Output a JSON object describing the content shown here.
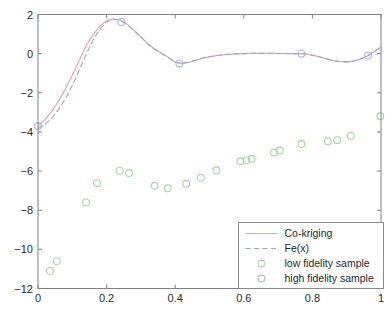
{
  "chart_data": {
    "type": "line",
    "title": "",
    "subtitle": "",
    "xlabel": "",
    "ylabel": "",
    "xlim": [
      0,
      1
    ],
    "ylim": [
      -12,
      2
    ],
    "grid": false,
    "xticks": [
      0,
      0.2,
      0.4,
      0.6,
      0.8,
      1
    ],
    "xtick_labels": [
      "0",
      "0.2",
      "0.4",
      "0.6",
      "0.8",
      "1"
    ],
    "yticks": [
      2,
      0,
      -2,
      -4,
      -6,
      -8,
      -10,
      -12
    ],
    "ytick_labels": [
      "2",
      "0",
      "-2",
      "-4",
      "-6",
      "-8",
      "-10",
      "-12"
    ],
    "legend": {
      "position": "lower right",
      "entries": [
        {
          "label": "Co-kriging",
          "marker": "line-solid",
          "color": "#e8a0a4"
        },
        {
          "label": "Fe(x)",
          "marker": "line-dashed",
          "color": "#9aa6c4"
        },
        {
          "label": "low fidelity sample",
          "marker": "circle",
          "color": "#a8d3a8"
        },
        {
          "label": "high fidelity sample",
          "marker": "circle",
          "color": "#a9b6d6"
        }
      ]
    },
    "series": [
      {
        "name": "Co-kriging",
        "type": "line",
        "style": "solid",
        "color": "#e8a0a4",
        "x": [
          0,
          0.02,
          0.04,
          0.06,
          0.08,
          0.1,
          0.12,
          0.14,
          0.16,
          0.18,
          0.2,
          0.22,
          0.24,
          0.26,
          0.28,
          0.3,
          0.32,
          0.34,
          0.36,
          0.38,
          0.4,
          0.42,
          0.44,
          0.46,
          0.48,
          0.5,
          0.52,
          0.54,
          0.56,
          0.58,
          0.6,
          0.62,
          0.64,
          0.66,
          0.68,
          0.7,
          0.72,
          0.74,
          0.76,
          0.78,
          0.8,
          0.82,
          0.84,
          0.86,
          0.88,
          0.9,
          0.92,
          0.94,
          0.96,
          0.98,
          1
        ],
        "y": [
          -3.7,
          -3.38,
          -2.95,
          -2.42,
          -1.8,
          -1.1,
          -0.35,
          0.4,
          0.95,
          1.4,
          1.68,
          1.77,
          1.72,
          1.5,
          1.2,
          0.85,
          0.52,
          0.24,
          0.02,
          -0.2,
          -0.44,
          -0.5,
          -0.44,
          -0.34,
          -0.24,
          -0.16,
          -0.1,
          -0.06,
          -0.03,
          -0.01,
          0.0,
          0.02,
          0.02,
          0.02,
          0.02,
          0.01,
          0.01,
          0.0,
          0.0,
          -0.02,
          -0.08,
          -0.16,
          -0.26,
          -0.35,
          -0.4,
          -0.42,
          -0.38,
          -0.28,
          -0.12,
          0.1,
          0.33
        ]
      },
      {
        "name": "Fe(x)",
        "type": "line",
        "style": "dashed",
        "color": "#9aa6c4",
        "x": [
          0,
          0.02,
          0.04,
          0.06,
          0.08,
          0.1,
          0.12,
          0.14,
          0.16,
          0.18,
          0.2,
          0.22,
          0.24,
          0.26,
          0.28,
          0.3,
          0.32,
          0.34,
          0.36,
          0.38,
          0.4,
          0.42,
          0.44,
          0.46,
          0.48,
          0.5,
          0.52,
          0.54,
          0.56,
          0.58,
          0.6,
          0.62,
          0.64,
          0.66,
          0.68,
          0.7,
          0.72,
          0.74,
          0.76,
          0.78,
          0.8,
          0.82,
          0.84,
          0.86,
          0.88,
          0.9,
          0.92,
          0.94,
          0.96,
          0.98,
          1
        ],
        "y": [
          -3.82,
          -3.62,
          -3.3,
          -2.85,
          -2.3,
          -1.62,
          -0.85,
          -0.05,
          0.68,
          1.25,
          1.62,
          1.76,
          1.7,
          1.48,
          1.18,
          0.84,
          0.5,
          0.22,
          0.0,
          -0.2,
          -0.44,
          -0.5,
          -0.44,
          -0.34,
          -0.24,
          -0.16,
          -0.1,
          -0.06,
          -0.03,
          -0.01,
          0.0,
          0.02,
          0.02,
          0.02,
          0.02,
          0.01,
          0.01,
          0.0,
          0.0,
          -0.02,
          -0.08,
          -0.16,
          -0.26,
          -0.35,
          -0.4,
          -0.42,
          -0.38,
          -0.28,
          -0.12,
          0.1,
          0.33
        ]
      },
      {
        "name": "low fidelity sample",
        "type": "scatter",
        "marker": "circle-open",
        "color": "#a8d3a8",
        "points": [
          {
            "x": 0.035,
            "y": -11.1
          },
          {
            "x": 0.055,
            "y": -10.6
          },
          {
            "x": 0.14,
            "y": -7.6
          },
          {
            "x": 0.172,
            "y": -6.62
          },
          {
            "x": 0.238,
            "y": -5.98
          },
          {
            "x": 0.265,
            "y": -6.1
          },
          {
            "x": 0.34,
            "y": -6.75
          },
          {
            "x": 0.378,
            "y": -6.88
          },
          {
            "x": 0.432,
            "y": -6.65
          },
          {
            "x": 0.475,
            "y": -6.34
          },
          {
            "x": 0.52,
            "y": -5.96
          },
          {
            "x": 0.59,
            "y": -5.5
          },
          {
            "x": 0.608,
            "y": -5.44
          },
          {
            "x": 0.623,
            "y": -5.37
          },
          {
            "x": 0.688,
            "y": -5.05
          },
          {
            "x": 0.705,
            "y": -4.95
          },
          {
            "x": 0.768,
            "y": -4.62
          },
          {
            "x": 0.845,
            "y": -4.47
          },
          {
            "x": 0.872,
            "y": -4.42
          },
          {
            "x": 0.912,
            "y": -4.2
          },
          {
            "x": 0.998,
            "y": -3.2
          }
        ]
      },
      {
        "name": "high fidelity sample",
        "type": "scatter",
        "marker": "circle-open",
        "color": "#a9b6d6",
        "points": [
          {
            "x": 0.0,
            "y": -3.7
          },
          {
            "x": 0.243,
            "y": 1.62
          },
          {
            "x": 0.412,
            "y": -0.5
          },
          {
            "x": 0.768,
            "y": 0.0
          },
          {
            "x": 0.962,
            "y": -0.1
          }
        ]
      }
    ]
  },
  "axes": {
    "box_color": "#808080",
    "tick_color": "#808080"
  }
}
